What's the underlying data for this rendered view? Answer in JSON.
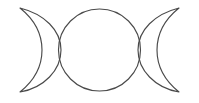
{
  "image": {
    "title": "Triple Moon Symbol",
    "subject": "triple-goddess-symbol",
    "alt_text": "Triple moon symbol: waxing crescent, full circle, waning crescent",
    "width": 199,
    "height": 103,
    "background_color": "#ffffff",
    "stroke_color": "#4a4a4a",
    "stroke_width": 1.15,
    "fill": "none"
  },
  "shapes": {
    "left_crescent": {
      "name": "waxing-crescent",
      "role": "maiden",
      "tip_top": [
        20,
        8
      ],
      "tip_bottom": [
        20,
        92
      ],
      "outer_extent_x": 30,
      "inner_extent_x": 61,
      "path": "M 20 8 C 44 14 61 30 61 50 C 61 70 44 88 20 92 C 35 80 42 66 42 50 C 42 34 35 20 20 8 Z"
    },
    "center_circle": {
      "name": "full-moon",
      "role": "mother",
      "center": [
        99.5,
        50
      ],
      "radius": 41,
      "bounds": {
        "x1": 58.5,
        "y1": 9,
        "x2": 140.5,
        "y2": 91
      }
    },
    "right_crescent": {
      "name": "waning-crescent",
      "role": "crone",
      "tip_top": [
        179,
        8
      ],
      "tip_bottom": [
        179,
        92
      ],
      "outer_extent_x": 169,
      "inner_extent_x": 138,
      "path": "M 179 8 C 155 14 138 30 138 50 C 138 70 155 88 179 92 C 164 80 157 66 157 50 C 157 34 164 20 179 8 Z"
    }
  },
  "labels": {
    "left_crescent": "Waxing crescent",
    "center_circle": "Full moon",
    "right_crescent": "Waning crescent"
  }
}
